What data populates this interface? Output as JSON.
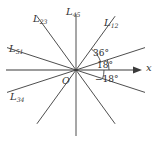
{
  "figure": {
    "background_color": "#ffffff",
    "stroke_color": "#3a3a3a",
    "text_color": "#333333",
    "origin": {
      "label": "O",
      "x": 76,
      "y": 70
    },
    "axis": {
      "name": "x-axis",
      "label": "x",
      "arrow": "right-arrow",
      "from_x": 6,
      "to_x": 140,
      "y": 70
    },
    "lines": [
      {
        "id": "L12",
        "base": "L",
        "sub": "12",
        "angle_deg": 54,
        "label_x": 104,
        "label_y": 18
      },
      {
        "id": "L23",
        "base": "L",
        "sub": "23",
        "angle_deg": 126,
        "label_x": 33,
        "label_y": 14
      },
      {
        "id": "L34",
        "base": "L",
        "sub": "34",
        "angle_deg": 162,
        "label_x": 10,
        "label_y": 92
      },
      {
        "id": "L45",
        "base": "L",
        "sub": "45",
        "angle_deg": 90,
        "label_x": 66,
        "label_y": 7
      },
      {
        "id": "L51",
        "base": "L",
        "sub": "51",
        "angle_deg": 18,
        "label_x": 9,
        "label_y": 44
      }
    ],
    "angles": [
      {
        "id": "angle-36",
        "text": "36°",
        "value": 36,
        "label_x": 93,
        "label_y": 49,
        "arc_radius": 26,
        "from_deg": 18,
        "to_deg": 54
      },
      {
        "id": "angle-18",
        "text": "18°",
        "value": 18,
        "label_x": 97,
        "label_y": 61,
        "arc_radius": 33,
        "from_deg": 0,
        "to_deg": 18
      },
      {
        "id": "angle-m18",
        "text": "−18°",
        "value": -18,
        "label_x": 95,
        "label_y": 75,
        "arc_radius": 28,
        "from_deg": -18,
        "to_deg": 0
      }
    ]
  }
}
